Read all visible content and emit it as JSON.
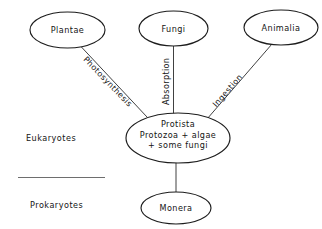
{
  "diagram": {
    "background_color": "#ffffff",
    "stroke_color": "#1d1d1d",
    "text_color": "#141414",
    "divider_color": "#6e6e6e"
  },
  "nodes": [
    {
      "id": "plantae",
      "label": "Plantae",
      "lines": [
        "Plantae"
      ]
    },
    {
      "id": "fungi",
      "label": "Fungi",
      "lines": [
        "Fungi"
      ]
    },
    {
      "id": "animalia",
      "label": "Animalia",
      "lines": [
        "Animalia"
      ]
    },
    {
      "id": "protista",
      "label": "Protista",
      "lines": [
        "Protista",
        "Protozoa + algae",
        "+ some fungi"
      ]
    },
    {
      "id": "monera",
      "label": "Monera",
      "lines": [
        "Monera"
      ]
    }
  ],
  "node_text": {
    "plantae": "Plantae",
    "fungi": "Fungi",
    "animalia": "Animalia",
    "protista_line1": "Protista",
    "protista_line2": "Protozoa + algae",
    "protista_line3": "+ some fungi",
    "monera": "Monera"
  },
  "edges": [
    {
      "id": "photosynthesis",
      "label": "Photosynthesis",
      "from": "plantae",
      "to": "protista"
    },
    {
      "id": "absorption",
      "label": "Absorption",
      "from": "fungi",
      "to": "protista"
    },
    {
      "id": "ingestion",
      "label": "Ingestion",
      "from": "animalia",
      "to": "protista"
    },
    {
      "id": "monera-link",
      "label": "",
      "from": "protista",
      "to": "monera"
    }
  ],
  "edge_text": {
    "photosynthesis": "Photosynthesis",
    "absorption": "Absorption",
    "ingestion": "Ingestion"
  },
  "groups": {
    "eukaryotes": "Eukaryotes",
    "prokaryotes": "Prokaryotes"
  }
}
